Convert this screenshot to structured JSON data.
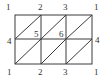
{
  "diagram": {
    "colors": {
      "line": "#3a3a3a",
      "text": "#333333",
      "background": "#ffffff"
    },
    "grid": {
      "x": [
        15,
        41,
        66,
        92
      ],
      "y": [
        15,
        39,
        64
      ]
    },
    "labels": {
      "top": [
        "1",
        "2",
        "3",
        "1"
      ],
      "middle_left": "4",
      "middle_right": "4",
      "interior": [
        "5",
        "6"
      ],
      "bottom": [
        "1",
        "2",
        "3",
        "1"
      ]
    }
  }
}
